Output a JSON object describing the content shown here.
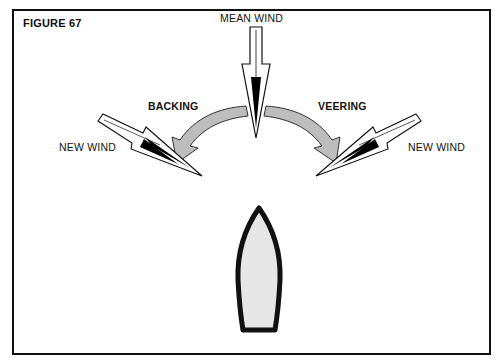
{
  "figure": {
    "label": "FIGURE 67"
  },
  "labels": {
    "mean_wind": "MEAN WIND",
    "backing": "BACKING",
    "veering": "VEERING",
    "new_wind_left": "NEW WIND",
    "new_wind_right": "NEW WIND"
  },
  "colors": {
    "border": "#111111",
    "curved_arrow_fill": "#bdbdbd",
    "boat_fill": "#e6e6e6",
    "boat_outline": "#111111",
    "arrow_head": "#000000"
  }
}
